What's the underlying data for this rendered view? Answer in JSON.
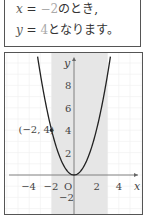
{
  "text": {
    "line1": {
      "var": "x",
      "eq": " = ",
      "val": "−2",
      "suffix": "のとき,"
    },
    "line2": {
      "var": "y",
      "eq": " = ",
      "val": "4",
      "suffix": "となります。"
    }
  },
  "colors": {
    "curve": "#222222",
    "shade": "#e6e6e6",
    "grid": "#eeeeee",
    "axis": "#666666",
    "frame": "#555555"
  },
  "chart_data": {
    "type": "line",
    "title": "",
    "function": "y = x^2",
    "xlabel": "x",
    "ylabel": "y",
    "xlim": [
      -5.5,
      6.3
    ],
    "ylim": [
      -3.5,
      11
    ],
    "x_ticks": [
      "-4",
      "-2",
      "O",
      "2",
      "4"
    ],
    "y_ticks": [
      "-2",
      "2",
      "4",
      "6",
      "8"
    ],
    "origin_label": "O",
    "grid": true,
    "shaded_region": {
      "x_from": -2,
      "x_to": 3
    },
    "series": [
      {
        "name": "y = x^2",
        "x": [
          -3.2,
          -3,
          -2.5,
          -2,
          -1.5,
          -1,
          -0.5,
          0,
          0.5,
          1,
          1.5,
          2,
          2.5,
          3,
          3.2
        ],
        "y": [
          10.24,
          9,
          6.25,
          4,
          2.25,
          1,
          0.25,
          0,
          0.25,
          1,
          2.25,
          4,
          6.25,
          9,
          10.24
        ]
      }
    ],
    "annotations": [
      {
        "text": "(−2, 4)",
        "x": -2,
        "y": 4
      }
    ]
  }
}
